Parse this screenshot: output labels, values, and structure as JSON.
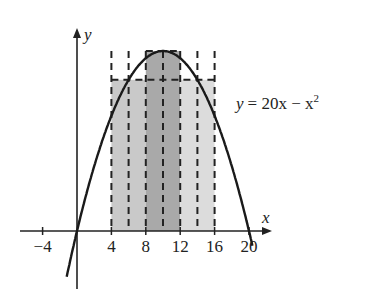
{
  "chart_data": {
    "type": "area",
    "title": "",
    "function_label": "y = 20x − x²",
    "equation": {
      "lhs": "y",
      "rhs_main": "= 20x − x",
      "rhs_exp": "2"
    },
    "xlabel": "x",
    "ylabel": "y",
    "xlim": [
      -6,
      22
    ],
    "ylim": [
      -30,
      115
    ],
    "x_ticks": [
      -4,
      4,
      8,
      12,
      16,
      20
    ],
    "x_tick_labels": [
      "−4",
      "4",
      "8",
      "12",
      "16",
      "20"
    ],
    "grid": false,
    "curve": {
      "function": "20x - x^2",
      "x_range": [
        -1.2,
        20.5
      ]
    },
    "rectangles": [
      {
        "x0": 4,
        "x1": 8,
        "height": 84,
        "fill": "#c9c9c9"
      },
      {
        "x0": 8,
        "x1": 12,
        "height": 100,
        "fill": "#a9a9a9"
      },
      {
        "x0": 12,
        "x1": 16,
        "height": 84,
        "fill": "#dcdcdc"
      }
    ],
    "dashed_verticals": [
      4,
      6,
      8,
      10,
      12,
      14,
      16
    ],
    "dashed_horizontal": {
      "y": 84,
      "x_range": [
        4,
        16
      ]
    },
    "top_box": {
      "x0": 8,
      "x1": 12,
      "y": 100
    }
  }
}
